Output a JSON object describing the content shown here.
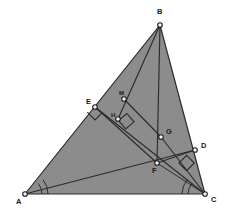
{
  "figure": {
    "canvas": {
      "width": 227,
      "height": 216
    },
    "colors": {
      "fill": "#8c8c8c",
      "stroke": "#2b2b2b",
      "background": "#ffffff",
      "vertex_dot_fill": "#f2f2f2",
      "label": "#1a1a1a"
    },
    "points": [
      {
        "id": "A",
        "label": "A",
        "x": 25,
        "y": 194,
        "label_x": 16,
        "label_y": 204,
        "on_fill": false
      },
      {
        "id": "B",
        "label": "B",
        "x": 160,
        "y": 25,
        "label_x": 157,
        "label_y": 14,
        "on_fill": false
      },
      {
        "id": "C",
        "label": "C",
        "x": 205,
        "y": 194,
        "label_x": 211,
        "label_y": 202,
        "on_fill": false
      },
      {
        "id": "D",
        "label": "D",
        "x": 195,
        "y": 150,
        "label_x": 201,
        "label_y": 148,
        "on_fill": false
      },
      {
        "id": "E",
        "label": "E",
        "x": 95,
        "y": 107,
        "label_x": 86,
        "label_y": 104,
        "on_fill": false
      },
      {
        "id": "F",
        "label": "F",
        "x": 157,
        "y": 163,
        "label_x": 152,
        "label_y": 172,
        "on_fill": true
      },
      {
        "id": "G",
        "label": "G",
        "x": 161,
        "y": 137,
        "label_x": 166,
        "label_y": 134,
        "on_fill": true
      },
      {
        "id": "H",
        "label": "H",
        "x": 118,
        "y": 119,
        "label_x": 112,
        "label_y": 116,
        "on_fill": true
      },
      {
        "id": "M",
        "label": "M",
        "x": 124,
        "y": 99,
        "label_x": 119,
        "label_y": 94,
        "on_fill": true
      }
    ],
    "triangle": {
      "vertices": [
        "A",
        "B",
        "C"
      ]
    },
    "segments": [
      {
        "name": "segment-A-B",
        "from": "A",
        "to": "B"
      },
      {
        "name": "segment-B-C",
        "from": "B",
        "to": "C"
      },
      {
        "name": "segment-A-C",
        "from": "A",
        "to": "C"
      },
      {
        "name": "segment-B-F",
        "from": "B",
        "to": "F"
      },
      {
        "name": "segment-B-H",
        "from": "B",
        "to": "H"
      },
      {
        "name": "segment-E-C",
        "from": "E",
        "to": "C"
      },
      {
        "name": "segment-A-D",
        "from": "A",
        "to": "D"
      },
      {
        "name": "segment-M-G",
        "from": "M",
        "to": "G"
      },
      {
        "name": "segment-E-F",
        "from": "E",
        "to": "F"
      },
      {
        "name": "segment-F-D",
        "from": "F",
        "to": "D"
      },
      {
        "name": "segment-G-C",
        "from": "G",
        "to": "C"
      },
      {
        "name": "segment-H-C",
        "from": "H",
        "to": "C"
      }
    ],
    "right_angle_marks": [
      {
        "name": "right-angle-at-E",
        "vertex": "E",
        "size": 11,
        "rotation": 45
      },
      {
        "name": "right-angle-at-H",
        "vertex": "H",
        "size": 11,
        "rotation": -36
      },
      {
        "name": "right-angle-at-D",
        "vertex": "D",
        "size": 11,
        "rotation": 208
      }
    ],
    "angle_arcs": [
      {
        "name": "angle-arc-A-inner",
        "vertex": "A",
        "radius": 17
      },
      {
        "name": "angle-arc-A-outer",
        "vertex": "A",
        "radius": 23
      },
      {
        "name": "angle-arc-C-inner",
        "vertex": "C",
        "radius": 17
      },
      {
        "name": "angle-arc-C-outer",
        "vertex": "C",
        "radius": 23
      }
    ]
  }
}
